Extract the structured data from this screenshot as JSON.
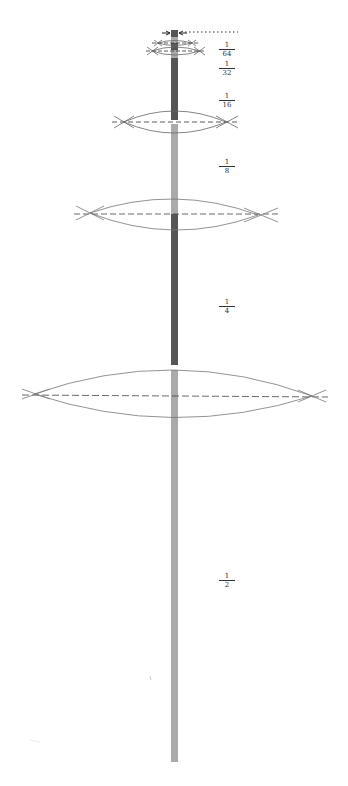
{
  "diagram": {
    "colors": {
      "rod_dark": "#555555",
      "rod_light": "#a8a8a8",
      "line": "#666666",
      "dash": "#444444"
    },
    "labels": [
      {
        "num": "1",
        "den": "64",
        "x": 219,
        "y": 41
      },
      {
        "num": "1",
        "den": "32",
        "x": 219,
        "y": 60
      },
      {
        "num": "1",
        "den": "16",
        "x": 219,
        "y": 92
      },
      {
        "num": "1",
        "den": "8",
        "x": 219,
        "y": 158
      },
      {
        "num": "1",
        "den": "4",
        "x": 219,
        "y": 298
      },
      {
        "num": "1",
        "den": "2",
        "x": 219,
        "y": 572
      }
    ]
  }
}
